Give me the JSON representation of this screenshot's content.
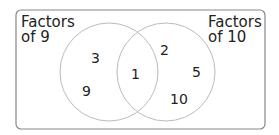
{
  "diagram": {
    "type": "venn",
    "sets": [
      {
        "label_line1": "Factors",
        "label_line2": "of 9",
        "only": [
          "3",
          "9"
        ]
      },
      {
        "label_line1": "Factors",
        "label_line2": "of 10",
        "only": [
          "2",
          "5",
          "10"
        ]
      }
    ],
    "intersection": [
      "1"
    ]
  },
  "labels": {
    "left_l1": "Factors",
    "left_l2": "of 9",
    "right_l1": "Factors",
    "right_l2": "of 10",
    "left_a": "3",
    "left_b": "9",
    "mid": "1",
    "right_a": "2",
    "right_b": "5",
    "right_c": "10"
  },
  "colors": {
    "border": "#888888",
    "circle": "#bbbbbb",
    "text": "#222222"
  }
}
